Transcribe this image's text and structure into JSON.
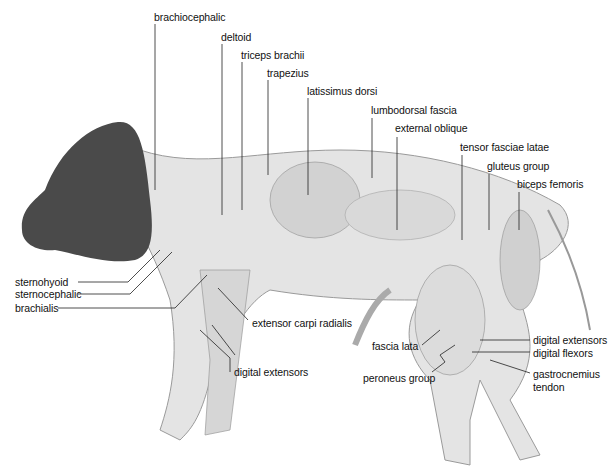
{
  "figure": {
    "colors": {
      "head": "#4a4a4a",
      "body": "#e6e6e6",
      "muscle": "#cfcfcf",
      "line": "#222222"
    }
  },
  "labels": {
    "brachiocephalic": "brachiocephalic",
    "deltoid": "deltoid",
    "triceps_brachii": "triceps brachii",
    "trapezius": "trapezius",
    "latissimus_dorsi": "latissimus dorsi",
    "lumbodorsal_fascia": "lumbodorsal fascia",
    "external_oblique": "external oblique",
    "tensor_fasciae_latae": "tensor fasciae latae",
    "gluteus_group": "gluteus group",
    "biceps_femoris": "biceps femoris",
    "sternohyoid": "sternohyoid",
    "sternocephalic": "sternocephalic",
    "brachialis": "brachialis",
    "extensor_carpi_radialis": "extensor carpi radialis",
    "digital_extensors_fore": "digital extensors",
    "fascia_lata": "fascia lata",
    "peroneus_group": "peroneus group",
    "digital_extensors_hind": "digital extensors",
    "digital_flexors": "digital flexors",
    "gastrocnemius_line1": "gastrocnemius",
    "gastrocnemius_line2": "tendon"
  }
}
